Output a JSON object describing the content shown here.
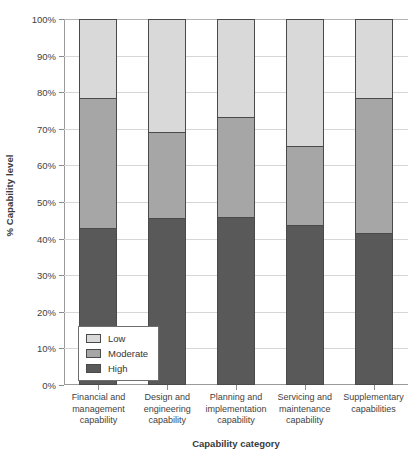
{
  "chart_data": {
    "type": "bar",
    "stacked": true,
    "stack_mode": "percent",
    "title": "",
    "xlabel": "Capability category",
    "ylabel": "% Capability level",
    "ylim": [
      0,
      100
    ],
    "ytick_labels": [
      "0%",
      "10%",
      "20%",
      "30%",
      "40%",
      "50%",
      "60%",
      "70%",
      "80%",
      "90%",
      "100%"
    ],
    "ytick_values": [
      0,
      10,
      20,
      30,
      40,
      50,
      60,
      70,
      80,
      90,
      100
    ],
    "grid": true,
    "legend_position": "bottom-left-inside",
    "categories": [
      "Financial and management capability",
      "Design and engineering capability",
      "Planning and implementation capability",
      "Servicing and maintenance capability",
      "Supplementary capabilities"
    ],
    "category_lines": [
      [
        "Financial and",
        "management",
        "capability"
      ],
      [
        "Design and",
        "engineering",
        "capability"
      ],
      [
        "Planning and",
        "implementation",
        "capability"
      ],
      [
        "Servicing and",
        "maintenance",
        "capability"
      ],
      [
        "Supplementary",
        "capabilities"
      ]
    ],
    "series": [
      {
        "name": "High",
        "color": "#595959",
        "values": [
          42.8,
          45.7,
          46.0,
          43.6,
          41.6
        ]
      },
      {
        "name": "Moderate",
        "color": "#a6a6a6",
        "values": [
          35.7,
          23.4,
          27.3,
          21.7,
          36.9
        ]
      },
      {
        "name": "Low",
        "color": "#d9d9d9",
        "values": [
          21.5,
          30.9,
          26.7,
          34.7,
          21.5
        ]
      }
    ],
    "stack_order_top_to_bottom": [
      "Low",
      "Moderate",
      "High"
    ]
  },
  "legend": {
    "items": [
      {
        "label": "Low",
        "color": "#d9d9d9"
      },
      {
        "label": "Moderate",
        "color": "#a6a6a6"
      },
      {
        "label": "High",
        "color": "#595959"
      }
    ]
  }
}
